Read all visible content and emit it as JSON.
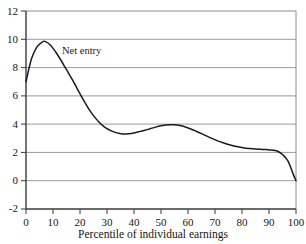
{
  "chart_data": {
    "type": "line",
    "title": "",
    "xlabel": "Percentile of individual earnings",
    "ylabel": "",
    "xlim": [
      0,
      100
    ],
    "ylim": [
      -2,
      12
    ],
    "xticks": [
      0,
      10,
      20,
      30,
      40,
      50,
      60,
      70,
      80,
      90,
      100
    ],
    "yticks": [
      12,
      10,
      8,
      6,
      4,
      2,
      0,
      -2
    ],
    "xtick_labels": [
      "0",
      "10",
      "20",
      "30",
      "40",
      "50",
      "60",
      "70",
      "80",
      "90",
      "100"
    ],
    "ytick_labels": [
      "12",
      "10",
      "8",
      "6",
      "4",
      "2",
      "0",
      "-2"
    ],
    "grid": "horizontal",
    "gridlines_at": [
      10,
      8,
      6,
      4,
      2,
      0
    ],
    "legend_position": "inline-annotation",
    "series": [
      {
        "name": "Net entry",
        "color": "#1a1a1a",
        "x": [
          0,
          2,
          4,
          6,
          7,
          9,
          11,
          13,
          15,
          17,
          19,
          21,
          23,
          25,
          27,
          29,
          31,
          33,
          35,
          36,
          38,
          40,
          42,
          44,
          46,
          48,
          50,
          52,
          54,
          55,
          57,
          59,
          61,
          63,
          65,
          67,
          69,
          71,
          73,
          75,
          77,
          79,
          81,
          83,
          85,
          87,
          89,
          91,
          93,
          95,
          97,
          99,
          100
        ],
        "values": [
          7.0,
          8.6,
          9.45,
          9.8,
          9.85,
          9.6,
          9.1,
          8.5,
          7.85,
          7.2,
          6.5,
          5.8,
          5.15,
          4.6,
          4.15,
          3.8,
          3.58,
          3.42,
          3.33,
          3.3,
          3.32,
          3.38,
          3.47,
          3.57,
          3.68,
          3.79,
          3.88,
          3.94,
          3.96,
          3.96,
          3.9,
          3.8,
          3.66,
          3.5,
          3.33,
          3.15,
          2.98,
          2.82,
          2.68,
          2.56,
          2.46,
          2.38,
          2.32,
          2.27,
          2.24,
          2.22,
          2.2,
          2.17,
          2.1,
          1.85,
          1.4,
          0.45,
          0.0
        ]
      }
    ],
    "annotations": [
      {
        "text": "Net entry",
        "x": 11,
        "y": 9.2
      }
    ]
  },
  "axes": {
    "x_title": "Percentile of individual earnings",
    "y_labels": [
      "12",
      "10",
      "8",
      "6",
      "4",
      "2",
      "0",
      "-2"
    ],
    "x_labels": [
      "0",
      "10",
      "20",
      "30",
      "40",
      "50",
      "60",
      "70",
      "80",
      "90",
      "100"
    ]
  },
  "annotation": {
    "net_entry_label": "Net entry"
  },
  "colors": {
    "curve": "#1a1a1a",
    "grid": "#9a9a9a",
    "frame": "#8c8c8c",
    "axis": "#555555",
    "background": "#ffffff",
    "text": "#161616"
  }
}
